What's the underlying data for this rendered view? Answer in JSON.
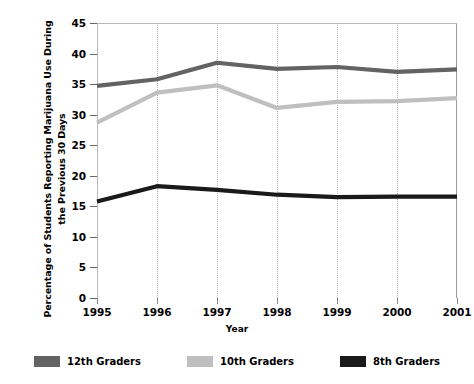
{
  "chart_data": {
    "type": "line",
    "title": "",
    "xlabel": "Year",
    "ylabel": "Percentage of Students Reporting Marijuana Use During the Previous 30 Days",
    "categories": [
      "1995",
      "1996",
      "1997",
      "1998",
      "1999",
      "2000",
      "2001"
    ],
    "x": [
      1995,
      1996,
      1997,
      1998,
      1999,
      2000,
      2001
    ],
    "xlim": [
      1995,
      2001
    ],
    "ylim": [
      0,
      45
    ],
    "yticks": [
      0,
      5,
      10,
      15,
      20,
      25,
      30,
      35,
      40,
      45
    ],
    "ytick_labels": [
      "0",
      "5",
      "10",
      "15",
      "20",
      "25",
      "30",
      "35",
      "40",
      "45"
    ],
    "grid": "vertical-dotted",
    "legend_position": "bottom",
    "series": [
      {
        "name": "12th Graders",
        "color": "#636363",
        "values": [
          34.7,
          35.8,
          38.5,
          37.5,
          37.8,
          37.0,
          37.4
        ]
      },
      {
        "name": "10th Graders",
        "color": "#bfbfbf",
        "values": [
          28.7,
          33.6,
          34.8,
          31.1,
          32.1,
          32.2,
          32.7
        ]
      },
      {
        "name": "8th Graders",
        "color": "#1a1a1a",
        "values": [
          15.8,
          18.3,
          17.7,
          16.9,
          16.5,
          16.6,
          16.6
        ]
      }
    ]
  },
  "legend": {
    "items": [
      {
        "label": "12th Graders",
        "color": "#636363"
      },
      {
        "label": "10th Graders",
        "color": "#bfbfbf"
      },
      {
        "label": "8th Graders",
        "color": "#1a1a1a"
      }
    ]
  }
}
